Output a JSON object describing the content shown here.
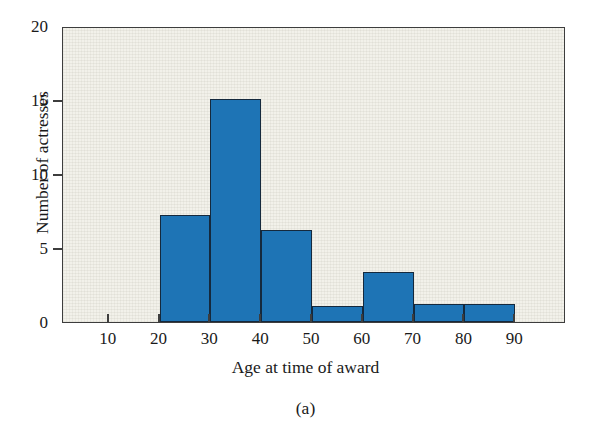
{
  "figure": {
    "caption": "(a)",
    "top_clipped_text": "",
    "colors": {
      "bar_fill": "#1E74B5",
      "bar_edge": "#15293D",
      "plot_background": "#F2F1EA",
      "frame": "#3D3D3D",
      "text": "#1A1A1A"
    }
  },
  "chart_data": {
    "type": "bar",
    "title": "",
    "subtitle": "",
    "xlabel": "Age at time of award",
    "ylabel": "Number of actresses",
    "xlim": [
      1,
      100
    ],
    "ylim": [
      0,
      20
    ],
    "grid": false,
    "legend": null,
    "xticks": [
      10,
      20,
      30,
      40,
      50,
      60,
      70,
      80,
      90
    ],
    "xtick_labels": [
      "10",
      "20",
      "30",
      "40",
      "50",
      "60",
      "70",
      "80",
      "90"
    ],
    "yticks": [
      0,
      5,
      10,
      15,
      20
    ],
    "ytick_labels": [
      "0",
      "5",
      "10",
      "15",
      "20"
    ],
    "bin_width": 10,
    "bins": [
      {
        "label": "20-30",
        "start": 20,
        "end": 30,
        "value": 7.2
      },
      {
        "label": "30-40",
        "start": 30,
        "end": 40,
        "value": 15.1
      },
      {
        "label": "40-50",
        "start": 40,
        "end": 50,
        "value": 6.2
      },
      {
        "label": "50-60",
        "start": 50,
        "end": 60,
        "value": 1.1
      },
      {
        "label": "60-70",
        "start": 60,
        "end": 70,
        "value": 3.4
      },
      {
        "label": "70-80",
        "start": 70,
        "end": 80,
        "value": 1.2
      },
      {
        "label": "80-90",
        "start": 80,
        "end": 90,
        "value": 1.2
      }
    ],
    "categories": [
      "20-30",
      "30-40",
      "40-50",
      "50-60",
      "60-70",
      "70-80",
      "80-90"
    ],
    "values": [
      7.2,
      15.1,
      6.2,
      1.1,
      3.4,
      1.2,
      1.2
    ]
  }
}
